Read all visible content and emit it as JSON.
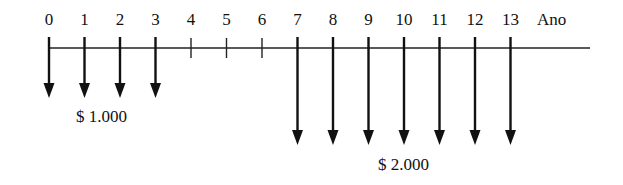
{
  "diagram": {
    "type": "cash-flow-timeline",
    "axis_label": "Ano",
    "periods": [
      "0",
      "1",
      "2",
      "3",
      "4",
      "5",
      "6",
      "7",
      "8",
      "9",
      "10",
      "11",
      "12",
      "13"
    ],
    "flows": [
      {
        "period": 0,
        "direction": "down",
        "group": "small"
      },
      {
        "period": 1,
        "direction": "down",
        "group": "small"
      },
      {
        "period": 2,
        "direction": "down",
        "group": "small"
      },
      {
        "period": 3,
        "direction": "down",
        "group": "small"
      },
      {
        "period": 7,
        "direction": "down",
        "group": "large"
      },
      {
        "period": 8,
        "direction": "down",
        "group": "large"
      },
      {
        "period": 9,
        "direction": "down",
        "group": "large"
      },
      {
        "period": 10,
        "direction": "down",
        "group": "large"
      },
      {
        "period": 11,
        "direction": "down",
        "group": "large"
      },
      {
        "period": 12,
        "direction": "down",
        "group": "large"
      },
      {
        "period": 13,
        "direction": "down",
        "group": "large"
      }
    ],
    "amount_labels": {
      "small": "$ 1.000",
      "large": "$ 2.000"
    },
    "colors": {
      "line": "#111111",
      "background": "#ffffff"
    }
  }
}
